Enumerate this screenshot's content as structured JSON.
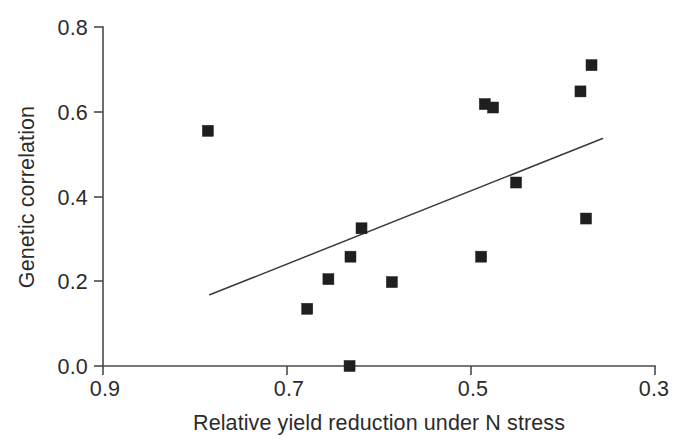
{
  "chart_data": {
    "type": "scatter",
    "title": "",
    "xlabel": "Relative yield reduction under N stress",
    "ylabel": "Genetic correlation",
    "xlim": [
      0.9,
      0.3
    ],
    "ylim": [
      0.0,
      0.8
    ],
    "x_reversed": true,
    "grid": false,
    "legend": null,
    "xticks": [
      "0.9",
      "0.7",
      "0.5",
      "0.3"
    ],
    "xtick_values": [
      0.9,
      0.7,
      0.5,
      0.3
    ],
    "yticks": [
      "0.0",
      "0.2",
      "0.4",
      "0.6",
      "0.8"
    ],
    "ytick_values": [
      0.0,
      0.2,
      0.4,
      0.6,
      0.8
    ],
    "marker": "filled-square",
    "marker_color": "#1f1f1f",
    "points": [
      {
        "x": 0.786,
        "y": 0.555
      },
      {
        "x": 0.678,
        "y": 0.135
      },
      {
        "x": 0.655,
        "y": 0.205
      },
      {
        "x": 0.632,
        "y": 0.0
      },
      {
        "x": 0.631,
        "y": 0.258
      },
      {
        "x": 0.619,
        "y": 0.325
      },
      {
        "x": 0.586,
        "y": 0.198
      },
      {
        "x": 0.489,
        "y": 0.258
      },
      {
        "x": 0.485,
        "y": 0.618
      },
      {
        "x": 0.476,
        "y": 0.61
      },
      {
        "x": 0.451,
        "y": 0.433
      },
      {
        "x": 0.381,
        "y": 0.648
      },
      {
        "x": 0.375,
        "y": 0.348
      },
      {
        "x": 0.369,
        "y": 0.71
      }
    ],
    "trend_line": {
      "type": "linear-fit",
      "x_start": 0.784,
      "y_start": 0.168,
      "x_end": 0.357,
      "y_end": 0.537,
      "color": "#3a3a3a"
    }
  }
}
